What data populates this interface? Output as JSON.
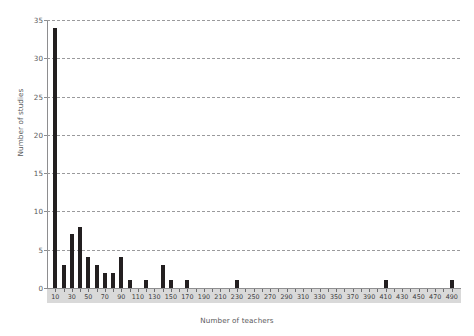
{
  "chart_data": {
    "type": "bar",
    "title": "",
    "xlabel": "Number of teachers",
    "ylabel": "Number of studies",
    "xlim": [
      0,
      500
    ],
    "ylim": [
      0,
      35
    ],
    "grid": true,
    "legend": null,
    "bin_width": 10,
    "y_ticks": [
      0,
      5,
      10,
      15,
      20,
      25,
      30,
      35
    ],
    "x_ticks": [
      10,
      30,
      50,
      70,
      90,
      110,
      130,
      150,
      170,
      190,
      210,
      230,
      250,
      270,
      290,
      310,
      330,
      350,
      370,
      390,
      410,
      430,
      450,
      470,
      490
    ],
    "x_tick_labels": [
      "10",
      "30",
      "50",
      "70",
      "90",
      "110",
      "130",
      "150",
      "170",
      "190",
      "210",
      "230",
      "250",
      "270",
      "290",
      "310",
      "330",
      "350",
      "370",
      "390",
      "410",
      "430",
      "450",
      "470",
      "490"
    ],
    "categories": [
      10,
      20,
      30,
      40,
      50,
      60,
      70,
      80,
      90,
      100,
      110,
      120,
      130,
      140,
      150,
      160,
      170,
      180,
      190,
      200,
      210,
      220,
      230,
      240,
      250,
      260,
      270,
      280,
      290,
      300,
      310,
      320,
      330,
      340,
      350,
      360,
      370,
      380,
      390,
      400,
      410,
      420,
      430,
      440,
      450,
      460,
      470,
      480,
      490
    ],
    "values": [
      34,
      3,
      7,
      8,
      4,
      3,
      2,
      2,
      4,
      1,
      0,
      1,
      0,
      3,
      1,
      0,
      1,
      0,
      0,
      0,
      0,
      0,
      1,
      0,
      0,
      0,
      0,
      0,
      0,
      0,
      0,
      0,
      0,
      0,
      0,
      0,
      0,
      0,
      0,
      0,
      1,
      0,
      0,
      0,
      0,
      0,
      0,
      0,
      1
    ],
    "bar_color": "#231f20",
    "axis_color": "#8e8e90",
    "grid_color": "#9a9a9c",
    "tick_band_color": "#d9d9d9",
    "text_color": "#58585a",
    "background": "#ffffff"
  }
}
